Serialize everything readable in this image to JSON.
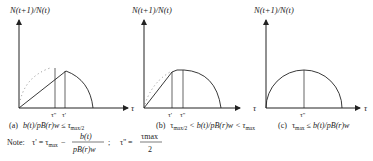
{
  "figure": {
    "y_axis_label": "N(t+1)/N(t)",
    "x_axis_label": "τ",
    "panels": [
      {
        "id": "a",
        "caption_prefix": "(a)",
        "caption_condition": "b(t)/pB(r)w ≤ τ",
        "caption_sub": "max/2",
        "ticks": [
          "τ''",
          "τ'"
        ]
      },
      {
        "id": "b",
        "caption_prefix": "(b)",
        "caption_t": "τ",
        "caption_sub1": "max/2",
        "caption_mid": " < b(t)/pB(r)w < τ",
        "caption_sub2": "max",
        "ticks": [
          "τ'",
          "τ''"
        ]
      },
      {
        "id": "c",
        "caption_prefix": "(c)",
        "caption_t": "τ",
        "caption_sub": "max",
        "caption_mid": " ≤ b(t)/pB(r)w",
        "ticks": [
          "τ''"
        ]
      }
    ],
    "note": {
      "label": "Note:",
      "tau_prime": "τ' = τ",
      "tau_prime_sub": "max",
      "minus": "−",
      "frac_num": "b(t)",
      "frac_den": "pB(r)w",
      "sep": ";",
      "tau_dprime": "τ'' =",
      "frac2_num": "τmax",
      "frac2_den": "2"
    }
  }
}
